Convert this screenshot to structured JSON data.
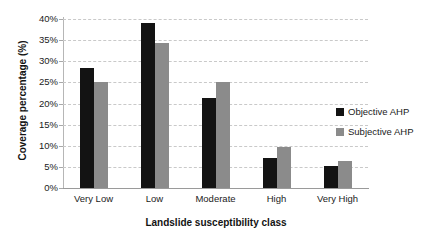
{
  "chart_data": {
    "type": "bar",
    "title": "",
    "xlabel": "Landslide susceptibility class",
    "ylabel": "Coverage percentage (%)",
    "categories": [
      "Very Low",
      "Low",
      "Moderate",
      "High",
      "Very High"
    ],
    "series": [
      {
        "name": "Objective AHP",
        "color": "#131313",
        "values": [
          28.5,
          39.0,
          21.3,
          7.0,
          5.3
        ]
      },
      {
        "name": "Subjective AHP",
        "color": "#8b8b8b",
        "values": [
          25.0,
          34.3,
          25.0,
          9.6,
          6.3
        ]
      }
    ],
    "ylim": [
      0,
      40
    ],
    "ytick_values": [
      0,
      5,
      10,
      15,
      20,
      25,
      30,
      35,
      40
    ],
    "ytick_labels": [
      "0%",
      "5%",
      "10%",
      "15%",
      "20%",
      "25%",
      "30%",
      "35%",
      "40%"
    ],
    "grid": true,
    "grid_axis": "y",
    "legend_position": "right",
    "legend": [
      "Objective AHP",
      "Subjective AHP"
    ]
  }
}
